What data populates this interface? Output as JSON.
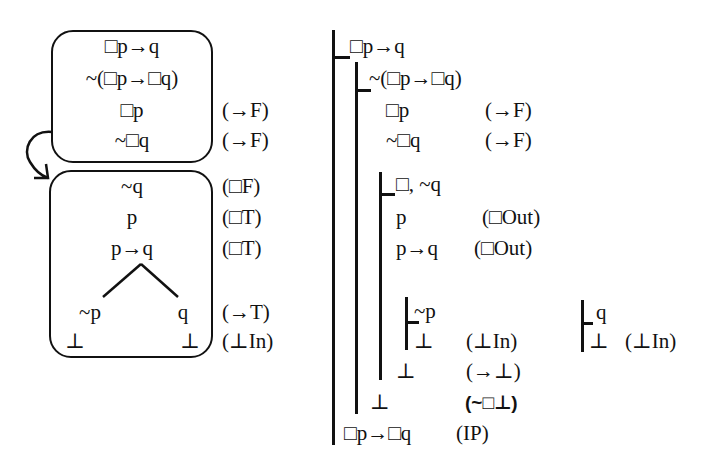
{
  "tableau": {
    "world1": {
      "lines": [
        "□p→q",
        "~(□p→□q)",
        "□p",
        "~□q"
      ],
      "justifications": [
        "",
        "",
        "(→F)",
        "(→F)"
      ]
    },
    "world2": {
      "lines": [
        "~q",
        "p",
        "p→q"
      ],
      "justifications": [
        "(□F)",
        "(□T)",
        "(□T)"
      ],
      "branch_left": {
        "formula": "~p",
        "closure": "⊥"
      },
      "branch_right": {
        "formula": "q",
        "closure": "⊥"
      },
      "branch_justification": "(→T)",
      "closure_justification": "(⊥In)"
    },
    "arrow_icon": "curved-arrow-accessibility"
  },
  "natural_deduction": {
    "premise": "□p→q",
    "assumption": "~(□p→□q)",
    "step3": {
      "formula": "□p",
      "rule": "(→F)"
    },
    "step4": {
      "formula": "~□q",
      "rule": "(→F)"
    },
    "boxed_subproof": {
      "head": "□, ~q",
      "step1": {
        "formula": "p",
        "rule": "(□Out)"
      },
      "step2": {
        "formula": "p→q",
        "rule": "(□Out)"
      },
      "left_case": {
        "assumption": "~p",
        "bottom": "⊥",
        "rule": "(⊥In)"
      },
      "right_case": {
        "assumption": "q",
        "bottom": "⊥",
        "rule": "(⊥In)"
      },
      "bottom": "⊥",
      "bottom_rule": "(→⊥)"
    },
    "outer_bottom": "⊥",
    "outer_bottom_rule": "(~□⊥)",
    "conclusion": {
      "formula": "□p→□q",
      "rule": "(IP)"
    }
  }
}
